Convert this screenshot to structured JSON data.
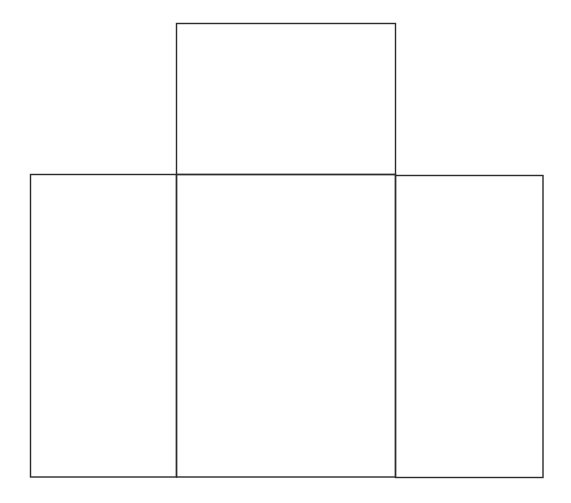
{
  "diagram": {
    "width": 571,
    "height": 503,
    "stroke_color": "#2b2b2b",
    "background": "#ffffff",
    "panels": [
      {
        "name": "top-panel",
        "x": 176.5,
        "y": 23.5,
        "w": 219,
        "h": 151
      },
      {
        "name": "left-panel",
        "x": 30.5,
        "y": 174.5,
        "w": 146,
        "h": 302.5
      },
      {
        "name": "center-panel",
        "x": 176.5,
        "y": 174.5,
        "w": 219,
        "h": 302.5
      },
      {
        "name": "right-panel",
        "x": 395.5,
        "y": 175.5,
        "w": 147.5,
        "h": 302
      }
    ]
  }
}
